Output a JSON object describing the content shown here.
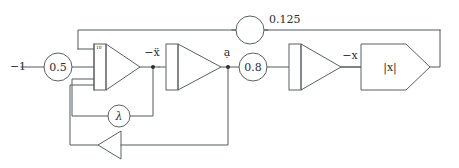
{
  "diagram": {
    "input": {
      "label": "−1"
    },
    "gains": {
      "input_gain": "0.5",
      "feedback_gain": "0.125",
      "mid_gain": "0.8",
      "lambda_gain": "λ"
    },
    "amplifier_labels": {
      "first_amp_coeff": "10"
    },
    "signals": {
      "second_derivative": "−ẍ",
      "first_derivative": "ạ",
      "position_negative": "−x"
    },
    "blocks": {
      "abs_block": "|x|"
    },
    "colors": {
      "wire": "#555b5e",
      "shape_stroke": "#5a6063",
      "text": "#2b2e30",
      "background": "#ffffff"
    }
  }
}
